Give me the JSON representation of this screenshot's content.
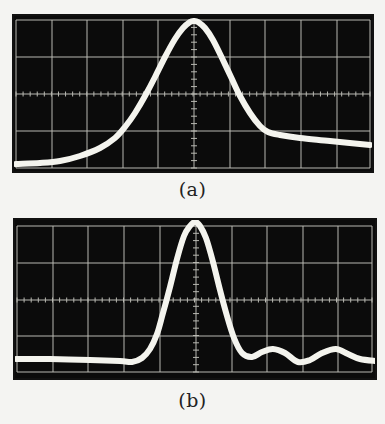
{
  "figure": {
    "panels": [
      {
        "id": "a",
        "caption": "(a)",
        "screen": {
          "x": 13,
          "y": 15,
          "w": 360,
          "h": 157
        },
        "grid": {
          "x_lines": [
            16,
            52,
            87,
            123,
            158,
            194,
            230,
            265,
            301,
            337,
            370
          ],
          "y_lines": [
            20,
            57,
            94,
            131,
            168
          ],
          "center_x": 194,
          "center_y": 94
        },
        "trace": [
          [
            16,
            164
          ],
          [
            40,
            163
          ],
          [
            60,
            161
          ],
          [
            80,
            156
          ],
          [
            100,
            148
          ],
          [
            115,
            138
          ],
          [
            125,
            127
          ],
          [
            135,
            113
          ],
          [
            145,
            96
          ],
          [
            155,
            77
          ],
          [
            165,
            57
          ],
          [
            175,
            39
          ],
          [
            183,
            28
          ],
          [
            190,
            22
          ],
          [
            194,
            21
          ],
          [
            198,
            22
          ],
          [
            205,
            28
          ],
          [
            213,
            40
          ],
          [
            222,
            58
          ],
          [
            231,
            77
          ],
          [
            240,
            96
          ],
          [
            250,
            113
          ],
          [
            260,
            126
          ],
          [
            268,
            132
          ],
          [
            280,
            135
          ],
          [
            300,
            138
          ],
          [
            330,
            141
          ],
          [
            370,
            145
          ]
        ]
      },
      {
        "id": "b",
        "caption": "(b)",
        "screen": {
          "x": 14,
          "y": 219,
          "w": 362,
          "h": 160
        },
        "grid": {
          "x_lines": [
            17,
            53,
            88,
            124,
            160,
            196,
            232,
            267,
            303,
            338,
            372
          ],
          "y_lines": [
            226,
            263,
            300,
            336,
            372
          ],
          "center_x": 196,
          "center_y": 300
        },
        "trace": [
          [
            16,
            359
          ],
          [
            50,
            359
          ],
          [
            90,
            360
          ],
          [
            120,
            361
          ],
          [
            132,
            362
          ],
          [
            142,
            358
          ],
          [
            150,
            349
          ],
          [
            157,
            334
          ],
          [
            163,
            313
          ],
          [
            170,
            287
          ],
          [
            177,
            259
          ],
          [
            184,
            236
          ],
          [
            190,
            226
          ],
          [
            195,
            222
          ],
          [
            200,
            226
          ],
          [
            206,
            238
          ],
          [
            213,
            262
          ],
          [
            220,
            290
          ],
          [
            227,
            316
          ],
          [
            234,
            338
          ],
          [
            242,
            353
          ],
          [
            252,
            357
          ],
          [
            262,
            352
          ],
          [
            273,
            349
          ],
          [
            285,
            353
          ],
          [
            298,
            362
          ],
          [
            310,
            360
          ],
          [
            322,
            353
          ],
          [
            336,
            349
          ],
          [
            348,
            354
          ],
          [
            360,
            359
          ],
          [
            376,
            361
          ]
        ]
      }
    ]
  },
  "chart_data": [
    {
      "type": "line",
      "title": "(a)",
      "description": "Oscilloscope trace: single broad asymmetric peak on 10x4 graticule",
      "xlabel": "",
      "ylabel": "",
      "xlim": [
        0,
        10
      ],
      "ylim": [
        -2,
        2
      ],
      "grid": true,
      "series": [
        {
          "name": "trace-a",
          "x": [
            0.0,
            0.5,
            1.0,
            1.5,
            2.0,
            2.5,
            3.0,
            3.5,
            4.0,
            4.5,
            5.0,
            5.5,
            6.0,
            6.5,
            7.0,
            7.5,
            8.0,
            8.5,
            9.0,
            9.5,
            10.0
          ],
          "y": [
            -1.95,
            -1.93,
            -1.88,
            -1.78,
            -1.62,
            -1.35,
            -0.95,
            -0.35,
            0.45,
            1.3,
            1.97,
            1.4,
            0.5,
            -0.35,
            -0.95,
            -1.1,
            -1.18,
            -1.22,
            -1.27,
            -1.32,
            -1.38
          ]
        }
      ]
    },
    {
      "type": "line",
      "title": "(b)",
      "description": "Oscilloscope trace: narrow central peak with baseline ripples on right",
      "xlabel": "",
      "ylabel": "",
      "xlim": [
        0,
        10
      ],
      "ylim": [
        -2,
        2
      ],
      "grid": true,
      "series": [
        {
          "name": "trace-b",
          "x": [
            0.0,
            0.5,
            1.0,
            1.5,
            2.0,
            2.5,
            3.0,
            3.5,
            4.0,
            4.5,
            5.0,
            5.5,
            6.0,
            6.5,
            7.0,
            7.5,
            8.0,
            8.5,
            9.0,
            9.5,
            10.0
          ],
          "y": [
            -1.6,
            -1.6,
            -1.61,
            -1.63,
            -1.65,
            -1.68,
            -1.7,
            -1.3,
            -0.1,
            1.2,
            2.0,
            1.1,
            -0.5,
            -1.45,
            -1.53,
            -1.45,
            -1.68,
            -1.55,
            -1.45,
            -1.6,
            -1.65
          ]
        }
      ]
    }
  ]
}
